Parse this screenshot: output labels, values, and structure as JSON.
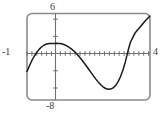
{
  "figure": {
    "kind": "graphing-calculator-plot",
    "colors": {
      "frame": "#8a8a8a",
      "axis": "#6f6f6f",
      "curve": "#1a1a1a",
      "label": "#3a3a3a",
      "background": "#ffffff"
    },
    "labels": {
      "ymax": "6",
      "ymin": "-8",
      "xmin": "-1",
      "xmax": "4"
    }
  },
  "chart_data": {
    "type": "line",
    "title": "",
    "xlabel": "",
    "ylabel": "",
    "xlim": [
      -1,
      4
    ],
    "ylim": [
      -8,
      6
    ],
    "grid": false,
    "legend": "none",
    "axis_ticks": {
      "x_tick_spacing": 0.2,
      "y_tick_spacing": 2,
      "x_ticks": [
        -1,
        -0.8,
        -0.6,
        -0.4,
        -0.2,
        0,
        0.2,
        0.4,
        0.6,
        0.8,
        1,
        1.2,
        1.4,
        1.6,
        1.8,
        2,
        2.2,
        2.4,
        2.6,
        2.8,
        3,
        3.2,
        3.4,
        3.6,
        3.8,
        4
      ],
      "y_ticks": [
        -8,
        -6,
        -4,
        -2,
        0,
        2,
        4,
        6
      ]
    },
    "window_corner_labels": {
      "top": "6",
      "bottom": "-8",
      "left": "-1",
      "right": "4"
    },
    "features": {
      "local_maximum": {
        "x": 0.4,
        "y": 1.1
      },
      "local_minimum": {
        "x": 2.7,
        "y": -6.2
      },
      "x_intercepts": [
        -0.75,
        1.35,
        3.75
      ],
      "left_endpoint": {
        "x": -1,
        "y": -3.4
      },
      "right_endpoint": {
        "x": 4,
        "y": 5.6
      }
    },
    "series": [
      {
        "name": "curve",
        "x": [
          -1.0,
          -0.9,
          -0.8,
          -0.7,
          -0.6,
          -0.5,
          -0.4,
          -0.3,
          -0.2,
          -0.1,
          0.0,
          0.1,
          0.2,
          0.3,
          0.4,
          0.5,
          0.6,
          0.7,
          0.8,
          0.9,
          1.0,
          1.1,
          1.2,
          1.3,
          1.4,
          1.5,
          1.6,
          1.7,
          1.8,
          1.9,
          2.0,
          2.1,
          2.2,
          2.3,
          2.4,
          2.5,
          2.6,
          2.7,
          2.8,
          2.9,
          3.0,
          3.1,
          3.2,
          3.3,
          3.4,
          3.5,
          3.6,
          3.7,
          3.8,
          3.9,
          4.0
        ],
        "y": [
          -3.4,
          -2.45,
          -1.6,
          -0.88,
          -0.27,
          0.23,
          0.62,
          0.9,
          1.06,
          1.13,
          1.15,
          1.16,
          1.17,
          1.16,
          1.1,
          0.98,
          0.8,
          0.56,
          0.27,
          -0.06,
          -0.44,
          -0.88,
          -1.36,
          -1.88,
          -2.42,
          -2.98,
          -3.54,
          -4.09,
          -4.62,
          -5.11,
          -5.54,
          -5.9,
          -6.14,
          -6.26,
          -6.23,
          -6.04,
          -5.66,
          -5.06,
          -4.23,
          -3.15,
          -1.8,
          -0.16,
          1.3,
          2.1,
          2.9,
          3.35,
          3.8,
          4.3,
          4.8,
          5.2,
          5.6
        ]
      }
    ]
  }
}
